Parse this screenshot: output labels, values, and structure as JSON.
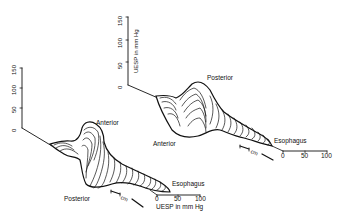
{
  "figure": {
    "left_plot": {
      "z_axis_ticks": [
        "0",
        "50",
        "100",
        "150"
      ],
      "labels": {
        "anterior": "Anterior",
        "posterior": "Posterior",
        "esophagus": "Esophagus"
      },
      "scale_bar": {
        "ticks": [
          "0",
          "50",
          "100"
        ],
        "title": "UESP in mm Hg"
      },
      "length_bar": {
        "unit": "cm"
      }
    },
    "right_plot": {
      "z_axis_ticks": [
        "0",
        "50",
        "100",
        "150"
      ],
      "z_axis_title": "UESP in mm Hg",
      "labels": {
        "posterior": "Posterior",
        "anterior": "Anterior",
        "esophagus": "Esophagus"
      },
      "scale_bar": {
        "ticks": [
          "0",
          "50",
          "100"
        ]
      },
      "length_bar": {
        "unit": "cm"
      }
    },
    "colors": {
      "ink": "#111111",
      "background": "#ffffff"
    }
  }
}
